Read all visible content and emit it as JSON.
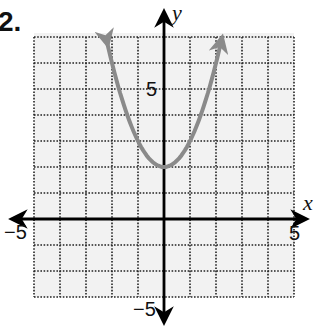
{
  "problem": {
    "number": "2."
  },
  "chart_data": {
    "type": "line",
    "title": "",
    "function": "y = x^2 + 2",
    "xlabel": "x",
    "ylabel": "y",
    "xlim": [
      -5,
      5
    ],
    "ylim": [
      -3,
      7
    ],
    "grid": true,
    "grid_style": "dotted",
    "grid_step": 1,
    "tick_labels": {
      "x": [
        "-5",
        "5"
      ],
      "y": [
        "5",
        "-5"
      ]
    },
    "vertex": [
      0,
      2
    ],
    "series": [
      {
        "name": "parabola",
        "color": "#8a8a8a",
        "arrows_at_ends": true,
        "x": [
          -2.2,
          -2,
          -1.5,
          -1,
          -0.5,
          0,
          0.5,
          1,
          1.5,
          2,
          2.2
        ],
        "y": [
          6.84,
          6,
          4.25,
          3,
          2.25,
          2,
          2.25,
          3,
          4.25,
          6,
          6.84
        ]
      }
    ],
    "colors": {
      "grid": "#222222",
      "axis": "#000000",
      "background": "#f2f2f2",
      "curve": "#8a8a8a"
    }
  },
  "labels": {
    "x_axis": "x",
    "y_axis": "y",
    "x_min": "−5",
    "x_max": "5",
    "y_pos": "5",
    "y_neg": "−5"
  }
}
